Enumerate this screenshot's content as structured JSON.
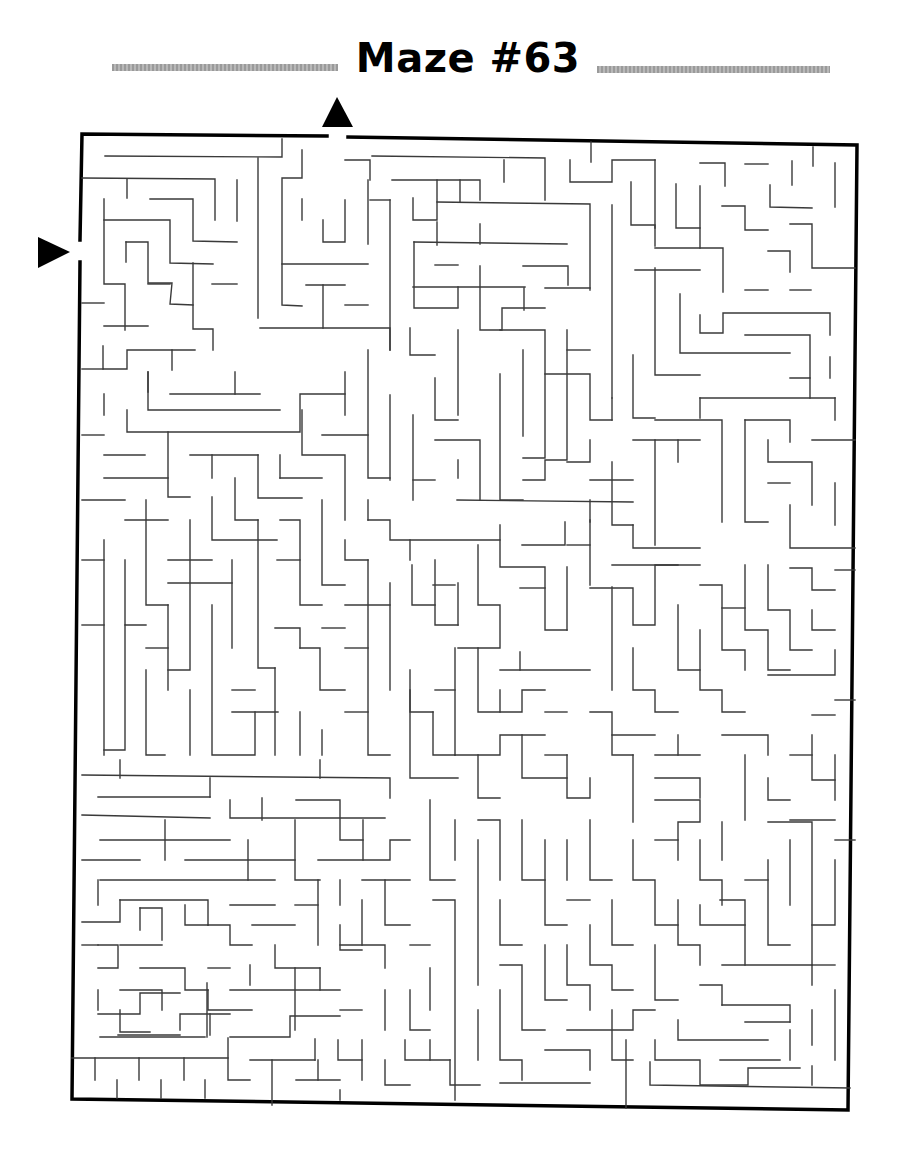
{
  "title": "Maze #63",
  "colors": {
    "ink": "#000000",
    "wall": "#3a3a3a",
    "title_bar": "#a8a8a8",
    "background": "#ffffff"
  },
  "maze": {
    "start_marker": "triangle-right-arrow at left edge",
    "end_marker": "triangle-up-arrow at top edge",
    "grid_cols": 36,
    "grid_rows": 45
  }
}
